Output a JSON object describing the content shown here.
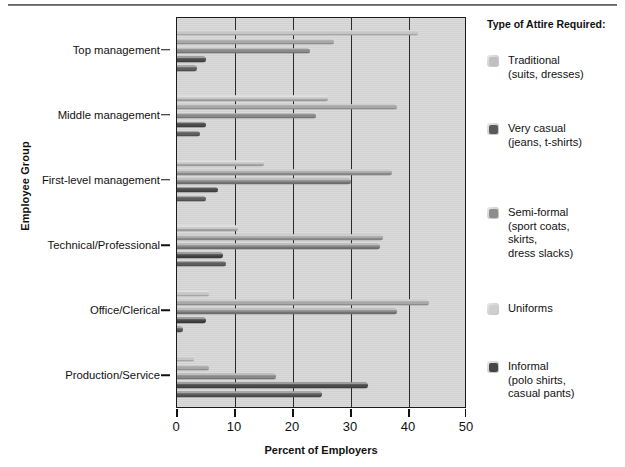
{
  "chart_data": {
    "type": "bar",
    "orientation": "horizontal",
    "title": "",
    "xlabel": "Percent of Employers",
    "ylabel": "Employee Group",
    "xlim": [
      0,
      50
    ],
    "xticks": [
      0,
      10,
      20,
      30,
      40,
      50
    ],
    "grid": true,
    "legend_position": "right",
    "legend_title": "Type of Attire Required:",
    "categories": [
      "Top management",
      "Middle management",
      "First-level management",
      "Technical/Professional",
      "Office/Clerical",
      "Production/Service"
    ],
    "series": [
      {
        "name": "Uniforms",
        "label_lines": [
          "Uniforms"
        ],
        "color": "#c6c6c6",
        "values": [
          41.5,
          26.0,
          15.0,
          10.5,
          5.5,
          3.0
        ]
      },
      {
        "name": "Traditional",
        "label_lines": [
          "Traditional",
          "(suits, dresses)"
        ],
        "color": "#a8a8a8",
        "values": [
          27.0,
          38.0,
          37.0,
          35.5,
          43.5,
          5.5
        ]
      },
      {
        "name": "Semi-formal",
        "label_lines": [
          "Semi-formal",
          "(sport coats,",
          "skirts,",
          "dress slacks)"
        ],
        "color": "#8a8a8a",
        "values": [
          23.0,
          24.0,
          30.0,
          35.0,
          38.0,
          17.0
        ]
      },
      {
        "name": "Informal",
        "label_lines": [
          "Informal",
          "(polo shirts,",
          "casual pants)"
        ],
        "color": "#4a4a4a",
        "values": [
          5.0,
          5.0,
          7.0,
          8.0,
          5.0,
          33.0
        ]
      },
      {
        "name": "Very casual",
        "label_lines": [
          "Very casual",
          "(jeans, t-shirts)"
        ],
        "color": "#5f5f5f",
        "values": [
          3.5,
          4.0,
          5.0,
          8.5,
          1.0,
          25.0
        ]
      }
    ],
    "bar_draw_order": [
      "Uniforms",
      "Traditional",
      "Semi-formal",
      "Informal",
      "Very casual"
    ]
  },
  "axes": {
    "y_title": "Employee Group",
    "x_title": "Percent of Employers",
    "x_tick_labels": [
      "0",
      "10",
      "20",
      "30",
      "40",
      "50"
    ],
    "y_tick_labels": [
      "Top management",
      "Middle management",
      "First-level management",
      "Technical/Professional",
      "Office/Clerical",
      "Production/Service"
    ]
  },
  "legend": {
    "title": "Type of Attire Required:",
    "items": [
      {
        "text": "Traditional\n(suits, dresses)",
        "color": "#c0c0c0"
      },
      {
        "text": "Very casual\n(jeans, t-shirts)",
        "color": "#5a5a5a"
      },
      {
        "text": "Semi-formal\n(sport coats,\nskirts,\ndress slacks)",
        "color": "#8d8d8d"
      },
      {
        "text": "Uniforms",
        "color": "#cfcfcf"
      },
      {
        "text": "Informal\n(polo shirts,\ncasual pants)",
        "color": "#454545"
      }
    ]
  },
  "colors": {
    "plot_background": "#d5d5d5",
    "axis": "#1a1a1a",
    "gridline": "#2a2a2a",
    "page_background": "#ffffff"
  }
}
